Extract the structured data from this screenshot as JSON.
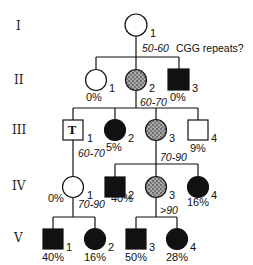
{
  "generations": [
    "I",
    "II",
    "III",
    "IV",
    "V"
  ],
  "annotations": {
    "gen1_repeats_italic": "50-60",
    "gen1_repeats_text": "CGG repeats?",
    "gen2_repeats": "60-70",
    "gen3_left_repeats": "60-70",
    "gen3_right_repeats": "70-90",
    "gen4_left_repeats": "70-90",
    "gen4_right_repeats": ">90"
  },
  "individuals": {
    "I1": {
      "number": "1",
      "sex": "female",
      "status": "normal",
      "percent": ""
    },
    "II1": {
      "number": "1",
      "sex": "female",
      "status": "normal",
      "percent": "0%"
    },
    "II2": {
      "number": "2",
      "sex": "female",
      "status": "carrier",
      "percent": ""
    },
    "II3": {
      "number": "3",
      "sex": "male",
      "status": "affected",
      "percent": "0%"
    },
    "III1": {
      "number": "1",
      "sex": "male",
      "status": "transmitting",
      "label": "T",
      "percent": ""
    },
    "III2": {
      "number": "2",
      "sex": "female",
      "status": "affected",
      "percent": "5%"
    },
    "III3": {
      "number": "3",
      "sex": "female",
      "status": "carrier",
      "percent": ""
    },
    "III4": {
      "number": "4",
      "sex": "male",
      "status": "normal",
      "percent": "9%"
    },
    "IV1": {
      "number": "1",
      "sex": "female",
      "status": "normal",
      "percent": "0%"
    },
    "IV2": {
      "number": "2",
      "sex": "male",
      "status": "affected",
      "percent": "40%"
    },
    "IV3": {
      "number": "3",
      "sex": "female",
      "status": "carrier",
      "percent": ""
    },
    "IV4": {
      "number": "4",
      "sex": "female",
      "status": "affected",
      "percent": "16%"
    },
    "V1": {
      "number": "1",
      "sex": "male",
      "status": "affected",
      "percent": "40%"
    },
    "V2": {
      "number": "2",
      "sex": "female",
      "status": "affected",
      "percent": "16%"
    },
    "V3": {
      "number": "3",
      "sex": "male",
      "status": "affected",
      "percent": "50%"
    },
    "V4": {
      "number": "4",
      "sex": "female",
      "status": "affected",
      "percent": "28%"
    }
  }
}
